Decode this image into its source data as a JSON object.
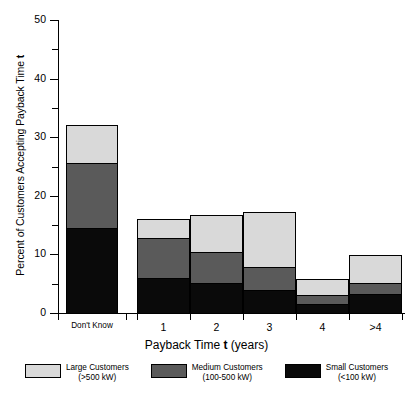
{
  "chart_data": {
    "type": "bar",
    "subtype": "stacked-bar",
    "title": "",
    "xlabel": "Payback Time t  (years)",
    "ylabel": "Percent of Customers Accepting Payback Time t",
    "categories": [
      "Don't Know",
      "1",
      "2",
      "3",
      "4",
      ">4"
    ],
    "series": [
      {
        "name": "Small Customers (<100 kW)",
        "color": "#0a0a0a",
        "values": [
          14.5,
          6.0,
          5.1,
          3.9,
          1.5,
          3.2
        ]
      },
      {
        "name": "Medium Customers (100-500 kW)",
        "color": "#5a5a5a",
        "values": [
          11.1,
          6.8,
          5.3,
          3.9,
          1.6,
          1.9
        ]
      },
      {
        "name": "Large Customers (>500 kW)",
        "color": "#d9d9d9",
        "values": [
          6.5,
          3.2,
          6.3,
          9.4,
          2.7,
          4.8
        ]
      }
    ],
    "totals": [
      32.1,
      16.0,
      16.7,
      17.2,
      5.8,
      9.9
    ],
    "ylim": [
      0,
      50
    ],
    "ytick_major": [
      0,
      10,
      20,
      30,
      40,
      50
    ],
    "ytick_minor": [
      5,
      15,
      25,
      35,
      45
    ],
    "grid": false,
    "legend_position": "bottom",
    "legend": [
      {
        "label": "Large Customers",
        "sublabel": "(>500 kW)",
        "color": "#d9d9d9"
      },
      {
        "label": "Medium Customers",
        "sublabel": "(100-500 kW)",
        "color": "#5a5a5a"
      },
      {
        "label": "Small Customers",
        "sublabel": "(<100 kW)",
        "color": "#0a0a0a"
      }
    ]
  },
  "axes": {
    "y_title_pre": "Percent of Customers Accepting Payback Time ",
    "y_title_var": "t",
    "x_title_pre": "Payback Time ",
    "x_title_var": "t",
    "x_title_post": "  (years)",
    "y_labels": [
      "50",
      "40",
      "30",
      "20",
      "10",
      "0"
    ],
    "x_labels": [
      "Don't Know",
      "1",
      "2",
      "3",
      "4",
      ">4"
    ]
  },
  "legend": {
    "items": [
      {
        "label": "Large Customers",
        "sublabel": "(>500 kW)"
      },
      {
        "label": "Medium Customers",
        "sublabel": "(100-500 kW)"
      },
      {
        "label": "Small Customers",
        "sublabel": "(<100 kW)"
      }
    ]
  }
}
